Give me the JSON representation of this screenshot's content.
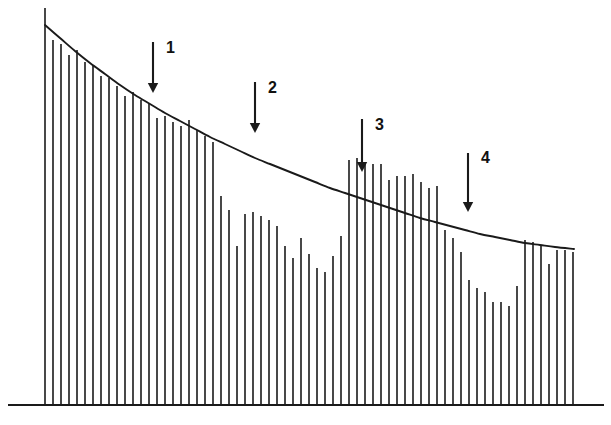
{
  "figure": {
    "title": "",
    "background_color": "#ffffff",
    "line_color": "#1a1a1a",
    "width": 611,
    "height": 425
  },
  "annotations": {
    "arrows": [
      {
        "label": "1",
        "x": 153,
        "y_start": 42,
        "y_end": 93,
        "label_x": 166,
        "label_y": 40
      },
      {
        "label": "2",
        "x": 255,
        "y_start": 82,
        "y_end": 133,
        "label_x": 268,
        "label_y": 80
      },
      {
        "label": "3",
        "x": 362,
        "y_start": 119,
        "y_end": 172,
        "label_x": 375,
        "label_y": 117
      },
      {
        "label": "4",
        "x": 468,
        "y_start": 153,
        "y_end": 212,
        "label_x": 481,
        "label_y": 150
      }
    ]
  },
  "chart_data": {
    "type": "bar",
    "title": "",
    "xlabel": "",
    "ylabel": "",
    "grid": false,
    "legend": null,
    "axis": {
      "baseline_y": 405,
      "x_min": 43,
      "x_max": 574,
      "y_top": 8,
      "bar_spacing": 8.0,
      "bar_width": 1.6
    },
    "envelope": {
      "description": "smooth exponentially decaying upper envelope curve drawn over the bar tops",
      "type": "line",
      "points": [
        [
          45,
          25
        ],
        [
          60,
          38
        ],
        [
          75,
          51
        ],
        [
          90,
          63
        ],
        [
          105,
          74
        ],
        [
          120,
          85
        ],
        [
          135,
          95
        ],
        [
          150,
          104
        ],
        [
          165,
          113
        ],
        [
          180,
          121
        ],
        [
          195,
          129
        ],
        [
          210,
          137
        ],
        [
          225,
          144
        ],
        [
          240,
          151
        ],
        [
          255,
          158
        ],
        [
          270,
          164
        ],
        [
          285,
          170
        ],
        [
          300,
          176
        ],
        [
          315,
          182
        ],
        [
          330,
          188
        ],
        [
          345,
          193
        ],
        [
          360,
          198
        ],
        [
          375,
          203
        ],
        [
          390,
          208
        ],
        [
          405,
          213
        ],
        [
          420,
          218
        ],
        [
          435,
          222
        ],
        [
          450,
          226
        ],
        [
          465,
          230
        ],
        [
          480,
          234
        ],
        [
          495,
          237
        ],
        [
          510,
          240
        ],
        [
          525,
          243
        ],
        [
          540,
          245
        ],
        [
          555,
          247
        ],
        [
          574,
          249
        ]
      ]
    },
    "categories": [
      "1",
      "2",
      "3",
      "4",
      "5",
      "6",
      "7",
      "8",
      "9",
      "10",
      "11",
      "12",
      "13",
      "14",
      "15",
      "16",
      "17",
      "18",
      "19",
      "20",
      "21",
      "22",
      "23",
      "24",
      "25",
      "26",
      "27",
      "28",
      "29",
      "30",
      "31",
      "32",
      "33",
      "34",
      "35",
      "36",
      "37",
      "38",
      "39",
      "40",
      "41",
      "42",
      "43",
      "44",
      "45",
      "46",
      "47",
      "48",
      "49",
      "50",
      "51",
      "52",
      "53",
      "54",
      "55",
      "56",
      "57",
      "58",
      "59",
      "60",
      "61",
      "62",
      "63",
      "64",
      "65",
      "66",
      "67"
    ],
    "bar_x": [
      45,
      53,
      61,
      69,
      77,
      85,
      93,
      101,
      109,
      117,
      125,
      133,
      141,
      149,
      157,
      165,
      173,
      181,
      189,
      197,
      205,
      213,
      221,
      229,
      237,
      245,
      253,
      261,
      269,
      277,
      285,
      293,
      301,
      309,
      317,
      325,
      333,
      341,
      349,
      357,
      365,
      373,
      381,
      389,
      397,
      405,
      413,
      421,
      429,
      437,
      445,
      453,
      461,
      469,
      477,
      485,
      493,
      501,
      509,
      517,
      525,
      533,
      541,
      549,
      557,
      565,
      573
    ],
    "bar_top_y": [
      8,
      40,
      44,
      55,
      50,
      62,
      66,
      76,
      78,
      86,
      96,
      92,
      100,
      104,
      118,
      116,
      122,
      126,
      120,
      130,
      136,
      142,
      196,
      210,
      246,
      214,
      212,
      216,
      220,
      226,
      246,
      258,
      238,
      254,
      268,
      272,
      256,
      236,
      160,
      158,
      162,
      164,
      164,
      180,
      176,
      176,
      174,
      182,
      188,
      186,
      230,
      238,
      252,
      280,
      288,
      292,
      302,
      302,
      306,
      286,
      240,
      242,
      246,
      264,
      250,
      250,
      252
    ],
    "bar_values_normalized": [
      1.0,
      0.919,
      0.909,
      0.881,
      0.894,
      0.864,
      0.854,
      0.829,
      0.824,
      0.804,
      0.779,
      0.789,
      0.768,
      0.758,
      0.723,
      0.728,
      0.713,
      0.703,
      0.718,
      0.693,
      0.678,
      0.663,
      0.526,
      0.491,
      0.401,
      0.481,
      0.486,
      0.476,
      0.466,
      0.451,
      0.401,
      0.37,
      0.421,
      0.38,
      0.345,
      0.335,
      0.375,
      0.425,
      0.617,
      0.622,
      0.612,
      0.607,
      0.607,
      0.567,
      0.577,
      0.577,
      0.582,
      0.562,
      0.547,
      0.552,
      0.441,
      0.421,
      0.385,
      0.315,
      0.295,
      0.285,
      0.259,
      0.259,
      0.249,
      0.3,
      0.416,
      0.411,
      0.401,
      0.355,
      0.391,
      0.391,
      0.386
    ]
  }
}
